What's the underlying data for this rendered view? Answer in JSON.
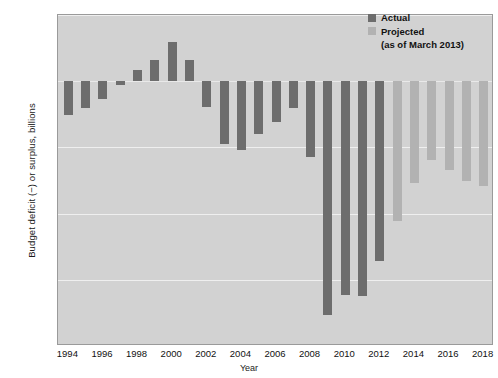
{
  "chart_data": {
    "type": "bar",
    "title": "",
    "xlabel": "Year",
    "ylabel": "Budget deficit (−) or surplus, billions",
    "ylim": [
      -1600,
      400
    ],
    "ytick_labels": [
      "$400",
      "0",
      "−400",
      "−800",
      "−1,200",
      "−1,600"
    ],
    "ytick_values": [
      400,
      0,
      -400,
      -800,
      -1200,
      -1600
    ],
    "xtick_labels": [
      "1994",
      "1996",
      "1998",
      "2000",
      "2002",
      "2004",
      "2006",
      "2008",
      "2010",
      "2012",
      "2014",
      "2016",
      "2018"
    ],
    "xtick_values": [
      1994,
      1996,
      1998,
      2000,
      2002,
      2004,
      2006,
      2008,
      2010,
      2012,
      2014,
      2016,
      2018
    ],
    "grid": true,
    "legend_position": "top-right",
    "categories": [
      1994,
      1995,
      1996,
      1997,
      1998,
      1999,
      2000,
      2001,
      2002,
      2003,
      2004,
      2005,
      2006,
      2007,
      2008,
      2009,
      2010,
      2011,
      2012,
      2013,
      2014,
      2015,
      2016,
      2017,
      2018
    ],
    "values": [
      -203,
      -164,
      -107,
      -22,
      69,
      126,
      236,
      128,
      -158,
      -378,
      -413,
      -318,
      -248,
      -161,
      -459,
      -1413,
      -1294,
      -1300,
      -1087,
      -845,
      -616,
      -475,
      -535,
      -605,
      -635
    ],
    "series": [
      {
        "name": "Actual",
        "color": "#6d6d6d",
        "x": [
          1994,
          1995,
          1996,
          1997,
          1998,
          1999,
          2000,
          2001,
          2002,
          2003,
          2004,
          2005,
          2006,
          2007,
          2008,
          2009,
          2010,
          2011,
          2012
        ],
        "values": [
          -203,
          -164,
          -107,
          -22,
          69,
          126,
          236,
          128,
          -158,
          -378,
          -413,
          -318,
          -248,
          -161,
          -459,
          -1413,
          -1294,
          -1300,
          -1087
        ]
      },
      {
        "name": "Projected",
        "color": "#b2b2b2",
        "x": [
          2013,
          2014,
          2015,
          2016,
          2017,
          2018
        ],
        "values": [
          -845,
          -616,
          -475,
          -535,
          -605,
          -635
        ]
      }
    ]
  },
  "legend": {
    "actual_label": "Actual",
    "projected_label": "Projected",
    "note": "(as of March 2013)"
  },
  "axes": {
    "y_title": "Budget deficit (−) or surplus, billions",
    "x_title": "Year"
  },
  "colors": {
    "plot_background": "#d2d2d2",
    "gridline": "#efefef",
    "actual": "#6d6d6d",
    "projected": "#b2b2b2",
    "page_background": "#ffffff"
  }
}
